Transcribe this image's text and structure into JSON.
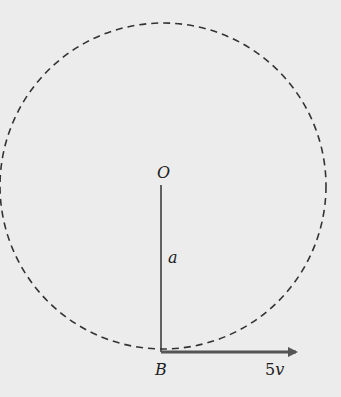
{
  "diagram": {
    "labels": {
      "center": "O",
      "radius": "a",
      "bottom_point": "B",
      "velocity_number": "5",
      "velocity_symbol": "v"
    },
    "colors": {
      "background": "#ececec",
      "stroke": "#333333",
      "arrow": "#555555"
    }
  }
}
